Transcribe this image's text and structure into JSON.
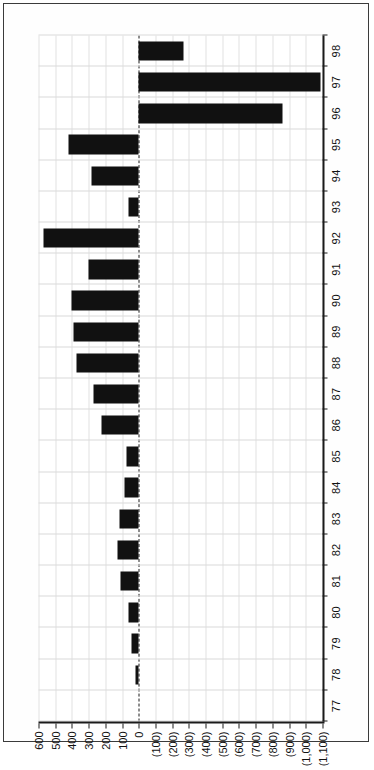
{
  "figure": {
    "name": "annual-net-change-bar-chart",
    "border_color": "#3b3b3b",
    "bar_color": "#111111",
    "grid_color": "#d9d9d9",
    "orientation": "rotated-90-ccw"
  },
  "chart_data": {
    "type": "bar",
    "title": "",
    "subtitle": "",
    "xlabel": "",
    "ylabel": "",
    "orientation": "vertical-bars-rotated",
    "grid": true,
    "legend": false,
    "legend_position": "none",
    "ylim": [
      -1100,
      600
    ],
    "ytick_step": 100,
    "categories": [
      "77",
      "78",
      "79",
      "80",
      "81",
      "82",
      "83",
      "84",
      "85",
      "86",
      "87",
      "88",
      "89",
      "90",
      "91",
      "92",
      "93",
      "94",
      "95",
      "96",
      "97",
      "98"
    ],
    "ytick_labels": [
      "600",
      "500",
      "400",
      "300",
      "200",
      "100",
      "0",
      "(100)",
      "(200)",
      "(300)",
      "(400)",
      "(500)",
      "(600)",
      "(700)",
      "(800)",
      "(900)",
      "(1,000)",
      "(1,100)"
    ],
    "ytick_values": [
      600,
      500,
      400,
      300,
      200,
      100,
      0,
      -100,
      -200,
      -300,
      -400,
      -500,
      -600,
      -700,
      -800,
      -900,
      -1000,
      -1100
    ],
    "values": [
      0,
      20,
      45,
      60,
      110,
      130,
      115,
      85,
      75,
      220,
      270,
      375,
      390,
      400,
      300,
      570,
      60,
      285,
      420,
      -860,
      -1090,
      -265
    ],
    "series": [
      {
        "name": "net change",
        "values": [
          0,
          20,
          45,
          60,
          110,
          130,
          115,
          85,
          75,
          220,
          270,
          375,
          390,
          400,
          300,
          570,
          60,
          285,
          420,
          -860,
          -1090,
          -265
        ]
      }
    ]
  }
}
